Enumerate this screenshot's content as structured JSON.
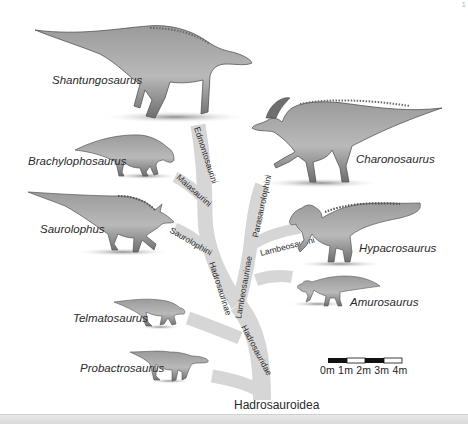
{
  "page_marker": "1",
  "root": {
    "label": "Hadrosauroidea"
  },
  "clades": {
    "hadrosauridae": "Hadrosauridae",
    "hadrosaurinae": "Hadrosaurinae",
    "lambeosaurinae": "Lambeosaurinae",
    "edmontosaurini": "Edmontosaurini",
    "maiasaurini": "Maiasaurini",
    "saurolophini": "Saurolophini",
    "parasaurolophini": "Parasaurolophini",
    "lambeosaurini": "Lambeosaurini"
  },
  "taxa": [
    {
      "id": "shantungosaurus",
      "label": "Shantungosaurus"
    },
    {
      "id": "charonosaurus",
      "label": "Charonosaurus"
    },
    {
      "id": "brachylophosaurus",
      "label": "Brachylophosaurus"
    },
    {
      "id": "saurolophus",
      "label": "Saurolophus"
    },
    {
      "id": "hypacrosaurus",
      "label": "Hypacrosaurus"
    },
    {
      "id": "amurosaurus",
      "label": "Amurosaurus"
    },
    {
      "id": "telmatosaurus",
      "label": "Telmatosaurus"
    },
    {
      "id": "probactrosaurus",
      "label": "Probactrosaurus"
    }
  ],
  "scale_bar": {
    "ticks": [
      "0m",
      "1m",
      "2m",
      "3m",
      "4m"
    ],
    "label_text": "0m  1m  2m  3m  4m",
    "segment_colors": [
      "#111111",
      "#ffffff",
      "#111111",
      "#ffffff"
    ]
  },
  "colors": {
    "branch": "#d6d6d6",
    "text": "#2a2a2a",
    "dino_body": "#8a8a8a",
    "dino_dark": "#5a5a5a",
    "shadow": "#9a9a9a"
  }
}
